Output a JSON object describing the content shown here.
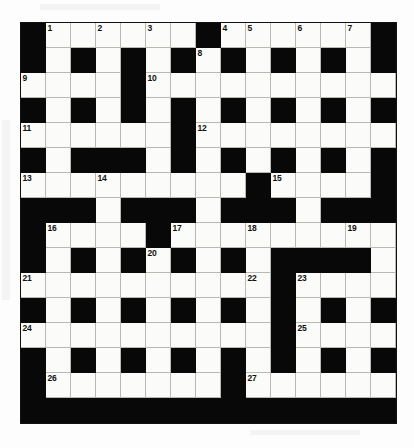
{
  "puzzle": {
    "title": "Crossword Grid",
    "columns": 15,
    "rows": 16,
    "cell_size_px": 25,
    "colors": {
      "block": "#080808",
      "cell": "#fbfbf9",
      "grid_line": "#b9b9b4",
      "number_text": "#111111",
      "page_background": "#fdfdfd"
    },
    "legend": {
      "black_symbol": "#",
      "white_symbol": "."
    },
    "grid_rows": [
      "#......#......#",
      "#.#.#.#.#.#.#.#",
      "....#..........",
      "#.#.#.#.#.#.#.#",
      "......#........",
      "#.###.#.#.#.#.#",
      ".........#....#",
      "###.###.###.###",
      "#....#.........",
      "#.#.#.#.#.####.",
      "..........#....",
      "#.#.#.#.#.#.#.#",
      "..........#....",
      "#.#.#.#.#.#.#.#",
      "#.......#......",
      "###############"
    ],
    "numbers": [
      {
        "n": 1,
        "row": 0,
        "col": 1
      },
      {
        "n": 2,
        "row": 0,
        "col": 3
      },
      {
        "n": 3,
        "row": 0,
        "col": 5
      },
      {
        "n": 4,
        "row": 0,
        "col": 8
      },
      {
        "n": 5,
        "row": 0,
        "col": 9
      },
      {
        "n": 6,
        "row": 0,
        "col": 11
      },
      {
        "n": 7,
        "row": 0,
        "col": 13
      },
      {
        "n": 8,
        "row": 1,
        "col": 7
      },
      {
        "n": 9,
        "row": 2,
        "col": 0
      },
      {
        "n": 10,
        "row": 2,
        "col": 5
      },
      {
        "n": 11,
        "row": 4,
        "col": 0
      },
      {
        "n": 12,
        "row": 4,
        "col": 7
      },
      {
        "n": 13,
        "row": 6,
        "col": 0
      },
      {
        "n": 14,
        "row": 6,
        "col": 3
      },
      {
        "n": 15,
        "row": 6,
        "col": 10
      },
      {
        "n": 16,
        "row": 8,
        "col": 1
      },
      {
        "n": 17,
        "row": 8,
        "col": 6
      },
      {
        "n": 18,
        "row": 8,
        "col": 9
      },
      {
        "n": 19,
        "row": 8,
        "col": 13
      },
      {
        "n": 20,
        "row": 9,
        "col": 5
      },
      {
        "n": 21,
        "row": 10,
        "col": 0
      },
      {
        "n": 22,
        "row": 10,
        "col": 9
      },
      {
        "n": 23,
        "row": 10,
        "col": 11
      },
      {
        "n": 24,
        "row": 12,
        "col": 0
      },
      {
        "n": 25,
        "row": 12,
        "col": 11
      },
      {
        "n": 26,
        "row": 14,
        "col": 1
      },
      {
        "n": 27,
        "row": 14,
        "col": 9
      }
    ]
  }
}
